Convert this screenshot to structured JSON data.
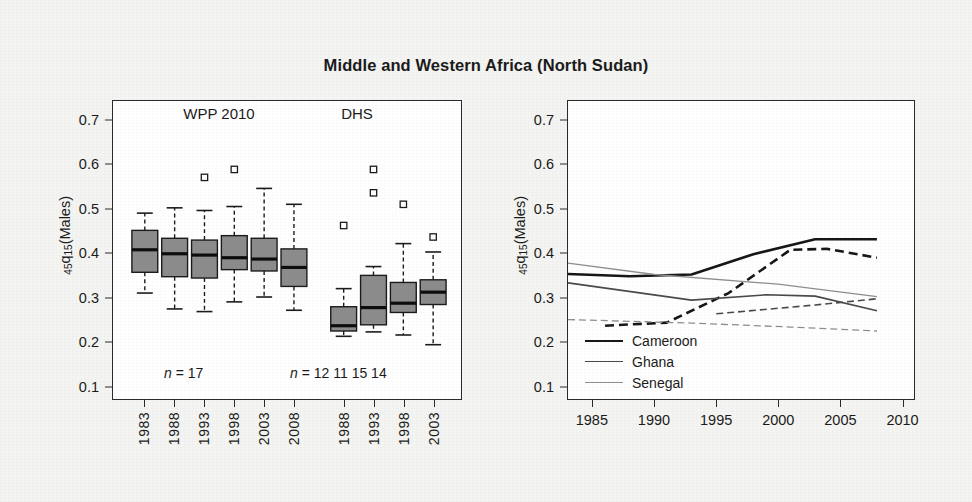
{
  "figure": {
    "title": "Middle and Western Africa (North Sudan)",
    "width": 972,
    "height": 502,
    "background": "#f4f4f2",
    "panel_background": "#ffffff",
    "frame_color": "#2a2a2a"
  },
  "axis": {
    "ylabel_prefix": "45",
    "ylabel_q": "q",
    "ylabel_sub": "15",
    "ylabel_suffix": "(Males)",
    "ylabel_full": "45q15(Males)",
    "yticks": [
      "0.7",
      "0.6",
      "0.5",
      "0.4",
      "0.3",
      "0.2",
      "0.1"
    ],
    "ylim": [
      0.07,
      0.745
    ],
    "grid": false
  },
  "left_panel": {
    "headers": [
      {
        "label": "WPP 2010"
      },
      {
        "label": "DHS"
      }
    ],
    "n_annotations": [
      {
        "prefix": "n",
        "eq": "= ",
        "values": "17"
      },
      {
        "prefix": "n",
        "eq": "= ",
        "values": "12  11  15  14"
      }
    ],
    "xticklabels": [
      "1983",
      "1988",
      "1993",
      "1998",
      "2003",
      "2008",
      "1988",
      "1993",
      "1998",
      "2003"
    ],
    "box_fill": "#8c8c8c",
    "median_color": "#111111"
  },
  "right_panel": {
    "xticklabels": [
      "1985",
      "1990",
      "1995",
      "2000",
      "2005",
      "2010"
    ],
    "xlim": [
      1983,
      2011
    ],
    "legend": {
      "position": "bottom-left",
      "entries": [
        {
          "label": "Cameroon",
          "color": "#171717",
          "width": 2.6
        },
        {
          "label": "Ghana",
          "color": "#4a4a4a",
          "width": 1.6
        },
        {
          "label": "Senegal",
          "color": "#8e8e8e",
          "width": 1.3
        }
      ]
    }
  },
  "chart_data": [
    {
      "type": "box",
      "panel": "left",
      "title": "WPP 2010 and DHS estimates of 45q15 (Males)",
      "xlabel": "",
      "ylabel": "45q15(Males)",
      "ylim": [
        0.07,
        0.745
      ],
      "groups": [
        {
          "name": "WPP 2010",
          "n_label": "n = 17",
          "boxes": [
            {
              "x": "1983",
              "n": 17,
              "whisker_low": 0.31,
              "q1": 0.357,
              "median": 0.408,
              "q3": 0.452,
              "whisker_high": 0.491,
              "outliers": []
            },
            {
              "x": "1988",
              "n": 17,
              "whisker_low": 0.274,
              "q1": 0.347,
              "median": 0.399,
              "q3": 0.434,
              "whisker_high": 0.503,
              "outliers": []
            },
            {
              "x": "1993",
              "n": 17,
              "whisker_low": 0.268,
              "q1": 0.344,
              "median": 0.396,
              "q3": 0.43,
              "whisker_high": 0.497,
              "outliers": [
                0.572
              ]
            },
            {
              "x": "1998",
              "n": 17,
              "whisker_low": 0.29,
              "q1": 0.363,
              "median": 0.39,
              "q3": 0.44,
              "whisker_high": 0.506,
              "outliers": [
                0.59
              ]
            },
            {
              "x": "2003",
              "n": 17,
              "whisker_low": 0.301,
              "q1": 0.36,
              "median": 0.387,
              "q3": 0.434,
              "whisker_high": 0.547,
              "outliers": []
            },
            {
              "x": "2008",
              "n": 17,
              "whisker_low": 0.271,
              "q1": 0.325,
              "median": 0.368,
              "q3": 0.41,
              "whisker_high": 0.511,
              "outliers": []
            }
          ]
        },
        {
          "name": "DHS",
          "n_label": "n = 12 11 15 14",
          "boxes": [
            {
              "x": "1988",
              "n": 12,
              "whisker_low": 0.212,
              "q1": 0.224,
              "median": 0.236,
              "q3": 0.279,
              "whisker_high": 0.32,
              "outliers": [
                0.463
              ]
            },
            {
              "x": "1993",
              "n": 11,
              "whisker_low": 0.222,
              "q1": 0.238,
              "median": 0.277,
              "q3": 0.35,
              "whisker_high": 0.37,
              "outliers": [
                0.59,
                0.537
              ]
            },
            {
              "x": "1998",
              "n": 15,
              "whisker_low": 0.215,
              "q1": 0.266,
              "median": 0.287,
              "q3": 0.334,
              "whisker_high": 0.422,
              "outliers": [
                0.511
              ]
            },
            {
              "x": "2003",
              "n": 14,
              "whisker_low": 0.193,
              "q1": 0.284,
              "median": 0.312,
              "q3": 0.34,
              "whisker_high": 0.403,
              "outliers": [
                0.437
              ]
            }
          ]
        }
      ]
    },
    {
      "type": "line",
      "panel": "right",
      "title": "Country trends in 45q15 (Males)",
      "xlabel": "",
      "ylabel": "45q15(Males)",
      "xlim": [
        1983,
        2011
      ],
      "ylim": [
        0.07,
        0.745
      ],
      "legend_position": "bottom-left",
      "series": [
        {
          "name": "Cameroon WPP",
          "country": "Cameroon",
          "source": "WPP 2010",
          "style": "solid",
          "color": "#171717",
          "width": 2.6,
          "x": [
            1983,
            1988,
            1993,
            1998,
            2003,
            2008
          ],
          "y": [
            0.353,
            0.348,
            0.352,
            0.398,
            0.432,
            0.432
          ]
        },
        {
          "name": "Cameroon DHS",
          "country": "Cameroon",
          "source": "DHS",
          "style": "dashed",
          "color": "#171717",
          "width": 2.6,
          "x": [
            1986,
            1991,
            1996,
            2001,
            2004,
            2008
          ],
          "y": [
            0.236,
            0.243,
            0.31,
            0.408,
            0.41,
            0.39
          ]
        },
        {
          "name": "Ghana WPP",
          "country": "Ghana",
          "source": "WPP 2010",
          "style": "solid",
          "color": "#4a4a4a",
          "width": 1.6,
          "x": [
            1983,
            1993,
            1999,
            2003,
            2008
          ],
          "y": [
            0.333,
            0.294,
            0.306,
            0.303,
            0.27
          ]
        },
        {
          "name": "Ghana DHS",
          "country": "Ghana",
          "source": "DHS",
          "style": "dashed",
          "color": "#4a4a4a",
          "width": 1.6,
          "x": [
            1995,
            2003,
            2008
          ],
          "y": [
            0.263,
            0.283,
            0.297
          ]
        },
        {
          "name": "Senegal WPP",
          "country": "Senegal",
          "source": "WPP 2010",
          "style": "solid",
          "color": "#8e8e8e",
          "width": 1.3,
          "x": [
            1983,
            1990,
            2000,
            2008
          ],
          "y": [
            0.378,
            0.352,
            0.33,
            0.302
          ]
        },
        {
          "name": "Senegal DHS",
          "country": "Senegal",
          "source": "DHS",
          "style": "dashed",
          "color": "#8e8e8e",
          "width": 1.3,
          "x": [
            1983,
            1993,
            2001,
            2008
          ],
          "y": [
            0.25,
            0.242,
            0.233,
            0.224
          ]
        }
      ]
    }
  ]
}
